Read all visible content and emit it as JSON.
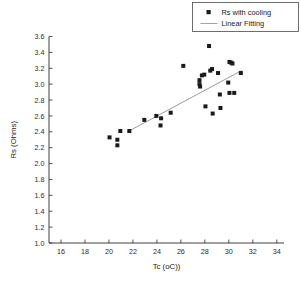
{
  "chart_data": {
    "type": "scatter",
    "title": "",
    "xlabel": "Tc (oC))",
    "ylabel": "Rs (Ohms)",
    "xlim": [
      15,
      34.6
    ],
    "ylim": [
      1.0,
      3.6
    ],
    "xticks": [
      16,
      18,
      20,
      22,
      24,
      26,
      28,
      30,
      32,
      34
    ],
    "xtick_labels": [
      "16",
      "18",
      "20",
      "22",
      "24",
      "26",
      "28",
      "30",
      "32",
      "34"
    ],
    "yticks": [
      1.0,
      1.2,
      1.4,
      1.6,
      1.8,
      2.0,
      2.2,
      2.4,
      2.6,
      2.8,
      3.0,
      3.2,
      3.4,
      3.6
    ],
    "ytick_labels": [
      "1.0",
      "1.2",
      "1.4",
      "1.6",
      "1.8",
      "2.0",
      "2.2",
      "2.4",
      "2.6",
      "2.8",
      "3.0",
      "3.2",
      "3.4",
      "3.6"
    ],
    "grid": false,
    "legend_position": "top-right",
    "series": [
      {
        "name": "Rs with cooling",
        "type": "scatter",
        "marker": "square",
        "color": "#1a1a1a",
        "points": [
          [
            20.05,
            2.33
          ],
          [
            20.7,
            2.3
          ],
          [
            20.7,
            2.23
          ],
          [
            20.95,
            2.41
          ],
          [
            21.7,
            2.41
          ],
          [
            22.95,
            2.55
          ],
          [
            23.95,
            2.6
          ],
          [
            24.35,
            2.57
          ],
          [
            24.3,
            2.48
          ],
          [
            25.15,
            2.64
          ],
          [
            26.2,
            3.23
          ],
          [
            27.55,
            3.05
          ],
          [
            27.55,
            3.0
          ],
          [
            27.6,
            2.97
          ],
          [
            27.75,
            3.11
          ],
          [
            27.95,
            3.12
          ],
          [
            28.05,
            2.72
          ],
          [
            28.35,
            3.48
          ],
          [
            28.45,
            3.17
          ],
          [
            28.6,
            3.19
          ],
          [
            28.65,
            2.63
          ],
          [
            29.1,
            3.14
          ],
          [
            29.25,
            2.87
          ],
          [
            29.3,
            2.7
          ],
          [
            29.95,
            3.02
          ],
          [
            30.05,
            3.28
          ],
          [
            30.2,
            3.27
          ],
          [
            30.3,
            3.26
          ],
          [
            30.05,
            2.89
          ],
          [
            30.45,
            2.89
          ],
          [
            31.0,
            3.14
          ]
        ]
      },
      {
        "name": "Linear Fitting",
        "type": "line",
        "color": "#6e6e6e",
        "endpoints": [
          [
            21.55,
            2.4
          ],
          [
            31.05,
            3.17
          ]
        ]
      }
    ]
  },
  "legend": {
    "entries": [
      {
        "label": "Rs with cooling",
        "marker": "square-marker"
      },
      {
        "label": "Linear Fitting",
        "marker": "line-marker"
      }
    ]
  }
}
